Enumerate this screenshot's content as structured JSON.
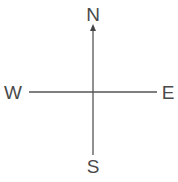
{
  "diagram": {
    "type": "compass",
    "arrow_direction": "north",
    "labels": {
      "north": "N",
      "south": "S",
      "east": "E",
      "west": "W"
    },
    "colors": {
      "line": "#555555",
      "text": "#4a4a4a",
      "background": "#ffffff"
    }
  }
}
